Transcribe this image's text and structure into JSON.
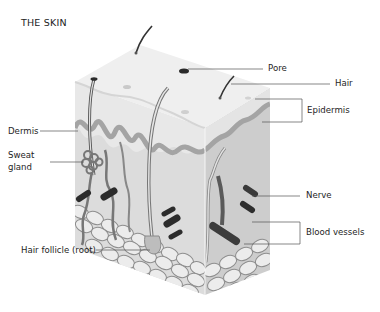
{
  "title": "THE SKIN",
  "labels": {
    "pore": "Pore",
    "hair": "Hair",
    "epidermis": "Epidermis",
    "dermis": "Dermis",
    "sweat_gland_line1": "Sweat",
    "sweat_gland_line2": "gland",
    "nerve": "Nerve",
    "blood_vessels": "Blood vessels",
    "hair_follicle": "Hair follicle (root)"
  },
  "colors": {
    "top_face": "#eeeeee",
    "front_face": "#d9d9d9",
    "side_face": "#cfcfcf",
    "wavy_layer": "#a8a8a8",
    "fat_cell_fill": "#ececec",
    "fat_cell_stroke": "#8e8e8e",
    "vessel": "#3a3a3a",
    "leader_line": "#555555"
  }
}
